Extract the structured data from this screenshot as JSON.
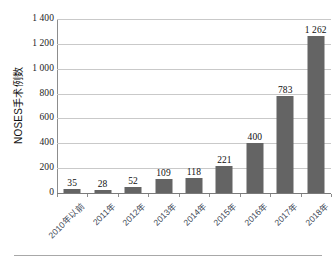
{
  "chart_data": {
    "type": "bar",
    "title": "",
    "xlabel": "",
    "ylabel": "NOSES手术例数",
    "categories": [
      "2010年以前",
      "2011年",
      "2012年",
      "2013年",
      "2014年",
      "2015年",
      "2016年",
      "2017年",
      "2018年"
    ],
    "values": [
      35,
      28,
      52,
      109,
      118,
      221,
      400,
      783,
      1262
    ],
    "value_labels": [
      "35",
      "28",
      "52",
      "109",
      "118",
      "221",
      "400",
      "783",
      "1 262"
    ],
    "ylim": [
      0,
      1400
    ],
    "ytick_values": [
      0,
      200,
      400,
      600,
      800,
      1000,
      1200,
      1400
    ],
    "ytick_labels": [
      "0",
      "200",
      "400",
      "600",
      "800",
      "1 000",
      "1 200",
      "1 400"
    ],
    "grid": "horizontal",
    "legend": "none",
    "series": [
      {
        "name": "NOSES手术例数",
        "values": [
          35,
          28,
          52,
          109,
          118,
          221,
          400,
          783,
          1262
        ]
      }
    ],
    "colors": {
      "bar": "#646464",
      "gridline": "#c9c9c9",
      "axis": "#8d8d8d",
      "value_label": "#101010",
      "tick_label": "#1b1b1b",
      "category_label": "#3a4452"
    }
  },
  "caption": {
    "rule": "",
    "text": ""
  }
}
